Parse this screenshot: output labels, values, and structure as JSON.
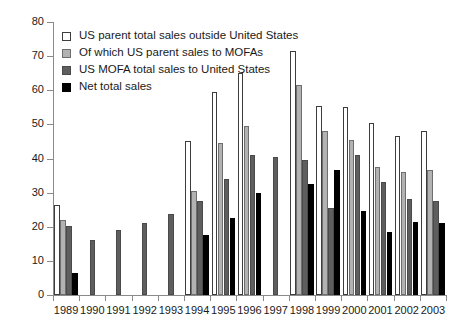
{
  "chart_data": {
    "type": "bar",
    "title": "",
    "xlabel": "",
    "ylabel": "",
    "ylim": [
      0,
      80
    ],
    "ytick_step": 10,
    "yticks": [
      0,
      10,
      20,
      30,
      40,
      50,
      60,
      70,
      80
    ],
    "grid": false,
    "legend_position": "top-left",
    "categories": [
      "1989",
      "1990",
      "1991",
      "1992",
      "1993",
      "1994",
      "1995",
      "1996",
      "1997",
      "1998",
      "1999",
      "2000",
      "2001",
      "2002",
      "2003"
    ],
    "series": [
      {
        "name": "US parent total sales outside United States",
        "color": "#ffffff",
        "values": [
          26.5,
          null,
          null,
          null,
          null,
          45,
          59.5,
          65,
          null,
          71.5,
          55.5,
          55,
          50.5,
          46.5,
          48
        ]
      },
      {
        "name": "Of which US parent sales to MOFAs",
        "color": "#b2b2b2",
        "values": [
          22,
          null,
          null,
          null,
          null,
          30.5,
          44.5,
          49.5,
          null,
          61.5,
          48,
          45.5,
          37.5,
          36,
          36.5
        ],
        "values_note": "1999 light gray bar extends only to 24.5 at its base segment; plotted height 48"
      },
      {
        "name": "US MOFA total sales to United States",
        "color": "#5e5e5e",
        "values": [
          20.2,
          16,
          19,
          21,
          23.7,
          27.5,
          34,
          41,
          40.5,
          39.5,
          25.5,
          41,
          33,
          28,
          27.5
        ]
      },
      {
        "name": "Net total sales",
        "color": "#000000",
        "values": [
          6.5,
          null,
          null,
          null,
          null,
          17.5,
          22.5,
          30,
          null,
          32.5,
          36.5,
          24.5,
          18.5,
          21.5,
          21
        ]
      }
    ]
  },
  "legend": {
    "items": [
      {
        "label": "US parent total sales outside United States",
        "swatch": "white-square-icon"
      },
      {
        "label": "Of which US parent sales to MOFAs",
        "swatch": "light-gray-square-icon"
      },
      {
        "label": "US MOFA total sales to United States",
        "swatch": "dark-gray-square-icon"
      },
      {
        "label": "Net total sales",
        "swatch": "black-square-icon"
      }
    ]
  }
}
